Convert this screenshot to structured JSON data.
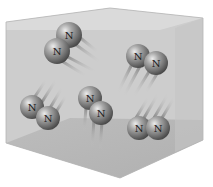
{
  "colors": {
    "background": "#ffffff",
    "box_face_front": "#c9c9c9",
    "box_face_top": "#e2e2e2",
    "box_face_floor": "#b9b9b9",
    "box_face_right": "#c2c2c2",
    "atom_light": "#e8e8e8",
    "atom_mid": "#9a9a9a",
    "atom_dark": "#4a4a4a",
    "trail": "#8a8a8a"
  },
  "atom_symbol": "N",
  "molecules": [
    {
      "id": "m1",
      "atoms": [
        {
          "label": "N",
          "x": 69,
          "y": 35
        },
        {
          "label": "N",
          "x": 57,
          "y": 51
        }
      ],
      "trail_dir": "down-right"
    },
    {
      "id": "m2",
      "atoms": [
        {
          "label": "N",
          "x": 138,
          "y": 56
        },
        {
          "label": "N",
          "x": 156,
          "y": 63
        }
      ],
      "trail_dir": "down-left"
    },
    {
      "id": "m3",
      "atoms": [
        {
          "label": "N",
          "x": 32,
          "y": 107
        },
        {
          "label": "N",
          "x": 48,
          "y": 118
        }
      ],
      "trail_dir": "up-right"
    },
    {
      "id": "m4",
      "atoms": [
        {
          "label": "N",
          "x": 90,
          "y": 98
        },
        {
          "label": "N",
          "x": 101,
          "y": 113
        }
      ],
      "trail_dir": "down"
    },
    {
      "id": "m5",
      "atoms": [
        {
          "label": "N",
          "x": 139,
          "y": 128
        },
        {
          "label": "N",
          "x": 158,
          "y": 128
        }
      ],
      "trail_dir": "up-right"
    }
  ],
  "labels": {
    "m1a": "N",
    "m1b": "N",
    "m2a": "N",
    "m2b": "N",
    "m3a": "N",
    "m3b": "N",
    "m4a": "N",
    "m4b": "N",
    "m5a": "N",
    "m5b": "N"
  }
}
